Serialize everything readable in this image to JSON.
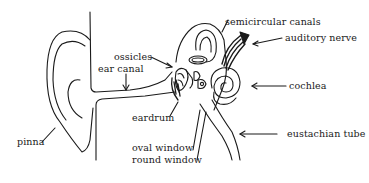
{
  "diagram": {
    "stroke_color": "#1a1a1a",
    "background": "#ffffff",
    "labels": {
      "semicircular_canals": "semicircular canals",
      "auditory_nerve": "auditory nerve",
      "ossicles": "ossicles",
      "ear_canal": "ear canal",
      "cochlea": "cochlea",
      "eardrum": "eardrum",
      "pinna": "pinna",
      "oval_window": "oval window",
      "round_window": "round window",
      "eustachian_tube": "eustachian tube"
    }
  }
}
